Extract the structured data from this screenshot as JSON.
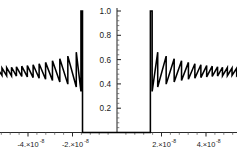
{
  "chart_data": {
    "type": "line",
    "title": "",
    "subtitle": "",
    "xlabel": "",
    "ylabel": "",
    "grid": false,
    "legend": null,
    "xlim": [
      -5.6e-08,
      5.6e-08
    ],
    "ylim": [
      0.0,
      1.05
    ],
    "x_tick_values": [
      -4e-08,
      -2e-08,
      2e-08,
      4e-08
    ],
    "x_tick_labels": [
      {
        "mantissa": "-4.",
        "times": "×",
        "base": "10",
        "exponent": "-8"
      },
      {
        "mantissa": "-2.",
        "times": "×",
        "base": "10",
        "exponent": "-8"
      },
      {
        "mantissa": "2.",
        "times": "×",
        "base": "10",
        "exponent": "-8"
      },
      {
        "mantissa": "4.",
        "times": "×",
        "base": "10",
        "exponent": "-8"
      }
    ],
    "x_minor_tick_count_between": 4,
    "y_tick_values": [
      0.2,
      0.4,
      0.6,
      0.8,
      1.0
    ],
    "y_tick_labels": [
      "0.2",
      "0.4",
      "0.6",
      "0.8",
      "1.0"
    ],
    "y_minor_tick_count_between": 4,
    "colors": {
      "curve": "#000000",
      "axis": "#2a2a2a",
      "tick_major": "#2a2a2a",
      "tick_minor": "#5a5a5a",
      "background": "#ffffff",
      "text": "#1a1a1a"
    },
    "annotations": [],
    "features": {
      "baseline_value": 0.5,
      "peak_value": 1.0,
      "gap_value": 0.0,
      "spike_left_x": -1.55e-08,
      "spike_right_x": 1.5e-08,
      "tooth_min_outer": 0.47,
      "tooth_max_outer": 0.53,
      "tooth_min_inner": 0.335,
      "tooth_max_inner": 0.68
    },
    "series": [
      {
        "name": "waveform",
        "points_left_sawtooth": [
          [
            -5.55e-08,
            0.5
          ],
          [
            -5.38e-08,
            0.468
          ],
          [
            -5.38e-08,
            0.529
          ],
          [
            -5.17e-08,
            0.47
          ],
          [
            -5.17e-08,
            0.531
          ],
          [
            -4.96e-08,
            0.468
          ],
          [
            -4.96e-08,
            0.534
          ],
          [
            -4.74e-08,
            0.466
          ],
          [
            -4.74e-08,
            0.537
          ],
          [
            -4.52e-08,
            0.464
          ],
          [
            -4.52e-08,
            0.541
          ],
          [
            -4.28e-08,
            0.461
          ],
          [
            -4.28e-08,
            0.546
          ],
          [
            -4.03e-08,
            0.457
          ],
          [
            -4.03e-08,
            0.551
          ],
          [
            -3.77e-08,
            0.452
          ],
          [
            -3.77e-08,
            0.558
          ],
          [
            -3.5e-08,
            0.446
          ],
          [
            -3.5e-08,
            0.566
          ],
          [
            -3.21e-08,
            0.438
          ],
          [
            -3.21e-08,
            0.577
          ],
          [
            -2.9e-08,
            0.428
          ],
          [
            -2.9e-08,
            0.59
          ],
          [
            -2.57e-08,
            0.415
          ],
          [
            -2.57e-08,
            0.607
          ],
          [
            -2.21e-08,
            0.398
          ],
          [
            -2.21e-08,
            0.629
          ],
          [
            -1.83e-08,
            0.374
          ],
          [
            -1.83e-08,
            0.661
          ],
          [
            -1.62e-08,
            0.338
          ],
          [
            -1.62e-08,
            1.0
          ],
          [
            -1.55e-08,
            1.0
          ],
          [
            -1.55e-08,
            0.0
          ]
        ],
        "points_center_gap": [
          [
            -1.55e-08,
            0.0
          ],
          [
            1.5e-08,
            0.0
          ]
        ],
        "points_right_sawtooth": [
          [
            1.5e-08,
            0.0
          ],
          [
            1.5e-08,
            1.0
          ],
          [
            1.58e-08,
            1.0
          ],
          [
            1.58e-08,
            0.338
          ],
          [
            1.83e-08,
            0.661
          ],
          [
            1.83e-08,
            0.374
          ],
          [
            2.21e-08,
            0.629
          ],
          [
            2.21e-08,
            0.398
          ],
          [
            2.57e-08,
            0.607
          ],
          [
            2.57e-08,
            0.415
          ],
          [
            2.9e-08,
            0.59
          ],
          [
            2.9e-08,
            0.428
          ],
          [
            3.21e-08,
            0.577
          ],
          [
            3.21e-08,
            0.438
          ],
          [
            3.5e-08,
            0.566
          ],
          [
            3.5e-08,
            0.446
          ],
          [
            3.77e-08,
            0.558
          ],
          [
            3.77e-08,
            0.452
          ],
          [
            4.03e-08,
            0.551
          ],
          [
            4.03e-08,
            0.457
          ],
          [
            4.28e-08,
            0.546
          ],
          [
            4.28e-08,
            0.461
          ],
          [
            4.52e-08,
            0.541
          ],
          [
            4.52e-08,
            0.464
          ],
          [
            4.74e-08,
            0.537
          ],
          [
            4.74e-08,
            0.466
          ],
          [
            4.96e-08,
            0.534
          ],
          [
            4.96e-08,
            0.468
          ],
          [
            5.17e-08,
            0.531
          ],
          [
            5.17e-08,
            0.47
          ],
          [
            5.38e-08,
            0.529
          ],
          [
            5.38e-08,
            0.468
          ],
          [
            5.55e-08,
            0.5
          ]
        ]
      }
    ]
  }
}
